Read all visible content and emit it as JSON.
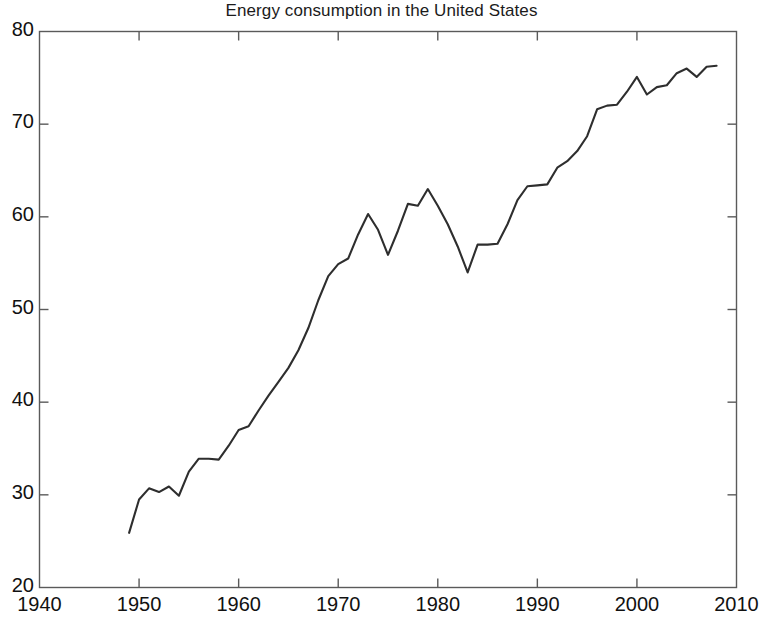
{
  "chart_data": {
    "type": "line",
    "title": "Energy consumption in the United States",
    "xlabel": "",
    "ylabel": "",
    "xlim": [
      1940,
      2010
    ],
    "ylim": [
      20,
      80
    ],
    "xticks": [
      1940,
      1950,
      1960,
      1970,
      1980,
      1990,
      2000,
      2010
    ],
    "yticks": [
      20,
      30,
      40,
      50,
      60,
      70,
      80
    ],
    "grid": false,
    "legend": null,
    "line_color": "#2e2e2e",
    "series": [
      {
        "name": "Energy consumption",
        "x": [
          1949,
          1950,
          1951,
          1952,
          1953,
          1954,
          1955,
          1956,
          1957,
          1958,
          1959,
          1960,
          1961,
          1962,
          1963,
          1964,
          1965,
          1966,
          1967,
          1968,
          1969,
          1970,
          1971,
          1972,
          1973,
          1974,
          1975,
          1976,
          1977,
          1978,
          1979,
          1980,
          1981,
          1982,
          1983,
          1984,
          1985,
          1986,
          1987,
          1988,
          1989,
          1990,
          1991,
          1992,
          1993,
          1994,
          1995,
          1996,
          1997,
          1998,
          1999,
          2000,
          2001,
          2002,
          2003,
          2004,
          2005,
          2006,
          2007,
          2008
        ],
        "values": [
          25.9,
          29.5,
          30.7,
          30.3,
          30.9,
          29.9,
          32.5,
          33.9,
          33.9,
          33.8,
          35.3,
          37.0,
          37.4,
          39.1,
          40.7,
          42.2,
          43.7,
          45.6,
          48.0,
          51.0,
          53.6,
          54.9,
          55.5,
          58.1,
          60.3,
          58.6,
          55.9,
          58.5,
          61.4,
          61.2,
          63.0,
          61.2,
          59.2,
          56.8,
          54.0,
          57.0,
          57.0,
          57.1,
          59.2,
          61.8,
          63.3,
          63.4,
          63.5,
          65.3,
          66.0,
          67.1,
          68.7,
          71.6,
          72.0,
          72.1,
          73.5,
          75.1,
          73.2,
          74.0,
          74.2,
          75.5,
          76.0,
          75.1,
          76.2,
          76.3
        ]
      }
    ]
  },
  "axes": {
    "x_tick_labels": [
      "1940",
      "1950",
      "1960",
      "1970",
      "1980",
      "1990",
      "2000",
      "2010"
    ],
    "y_tick_labels": [
      "80",
      "70",
      "60",
      "50",
      "40",
      "30",
      "20"
    ]
  }
}
